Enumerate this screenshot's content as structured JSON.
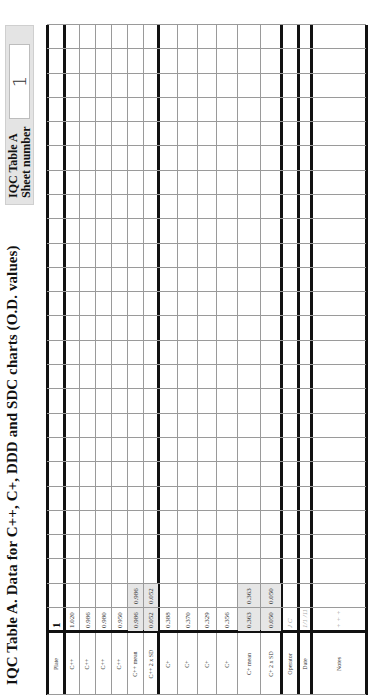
{
  "document": {
    "title": "IQC Table A. Data for C++, C+,  DDD and SDC charts (O.D. values)",
    "sheet_box": {
      "label_line1": "IQC Table A",
      "label_line2": "Sheet number",
      "sheet_number": "1"
    }
  },
  "table": {
    "row_labels": [
      "Plate",
      "C++",
      "C++",
      "C++",
      "C++",
      "C++ mean",
      "C++ 2 x SD",
      "C+",
      "C+",
      "C+",
      "C+",
      "C+ mean",
      "C+ 2 x SD",
      "Operator",
      "Date",
      "Notes"
    ],
    "column_count": 25,
    "columns": [
      {
        "plate": "1",
        "cpp": [
          "1.020",
          "0.986",
          "0.980",
          "0.950"
        ],
        "cpp_mean": "0.986",
        "cpp_2sd": "0.052",
        "cp": [
          "0.388",
          "0.370",
          "0.329",
          "0.356"
        ],
        "cp_mean": "0.363",
        "cp_2sd": "0.050",
        "operator": "J C",
        "date": "1/1 /11",
        "notes": "+ + +"
      },
      {
        "cpp_mean": "0.986",
        "cpp_2sd": "0.052",
        "cp_mean": "0.363",
        "cp_2sd": "0.050"
      }
    ]
  },
  "colors": {
    "header_box_bg": "#e4e4e4",
    "shaded_cell_bg": "#e6e6e6",
    "thin_line": "#9a9a9a",
    "thick_line": "#111111"
  }
}
